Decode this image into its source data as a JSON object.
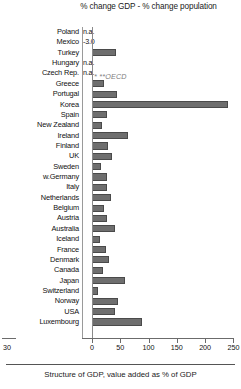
{
  "chart_data": {
    "type": "bar",
    "orientation": "horizontal",
    "title": "% change GDP - % change population",
    "xlabel": "",
    "ylabel": "",
    "xlim": [
      0,
      250
    ],
    "xticks": [
      0,
      50,
      100,
      150,
      200,
      250
    ],
    "xtick_labels": [
      "0",
      "50",
      "100",
      "150",
      "200",
      "250"
    ],
    "left_axis_stub_label": "30",
    "grid": false,
    "legend": false,
    "annotation": "* **OECD",
    "bar_color": "#6e6e6e",
    "categories": [
      "Poland",
      "Mexico",
      "Turkey",
      "Hungary",
      "Czech Rep.",
      "Greece",
      "Portugal",
      "Korea",
      "Spain",
      "New Zealand",
      "Ireland",
      "Finland",
      "UK",
      "Sweden",
      "w.Germany",
      "Italy",
      "Netherlands",
      "Belgium",
      "Austria",
      "Australia",
      "Iceland",
      "France",
      "Denmark",
      "Canada",
      "Japan",
      "Switzerland",
      "Norway",
      "USA",
      "Luxembourg"
    ],
    "values": [
      null,
      null,
      42,
      null,
      null,
      22,
      44,
      240,
      26,
      18,
      64,
      28,
      36,
      16,
      26,
      26,
      34,
      22,
      26,
      40,
      14,
      24,
      30,
      20,
      58,
      10,
      46,
      40,
      88
    ],
    "value_text": {
      "Poland": "n.a.",
      "Mexico": "-3.0",
      "Hungary": "n.a.",
      "Czech Rep.": "n.a."
    },
    "caption": "Structure of GDP, value added as % of GDP"
  }
}
